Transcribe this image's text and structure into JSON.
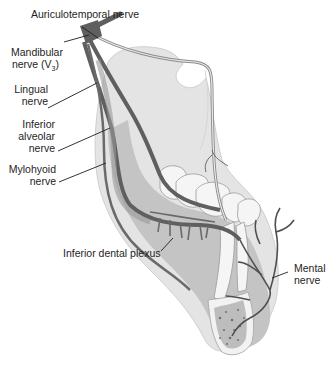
{
  "figure": {
    "labels": {
      "auriculotemporal": "Auriculotemporal nerve",
      "mandibular_line1": "Mandibular",
      "mandibular_line2": "nerve (V",
      "mandibular_sub": "3",
      "mandibular_close": ")",
      "lingual_line1": "Lingual",
      "lingual_line2": "nerve",
      "inferior_alveolar_line1": "Inferior",
      "inferior_alveolar_line2": "alveolar",
      "inferior_alveolar_line3": "nerve",
      "mylohyoid_line1": "Mylohyoid",
      "mylohyoid_line2": "nerve",
      "inferior_dental_plexus": "Inferior dental plexus",
      "mental_line1": "Mental",
      "mental_line2": "nerve"
    },
    "colors": {
      "nerve": "#5f5f5f",
      "nerve_light": "#8c8c8c",
      "bone": "#c8c8c8",
      "bone_light": "#e2e2e2",
      "teeth": "#f4f4f4",
      "text": "#1e1e1e"
    }
  }
}
